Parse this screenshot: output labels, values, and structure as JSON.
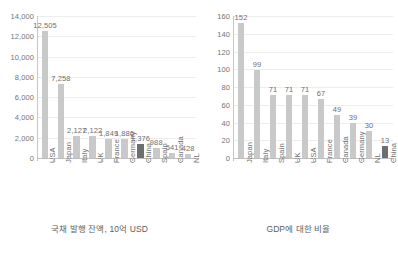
{
  "figure": {
    "width": 398,
    "height": 258,
    "background": "#ffffff",
    "bar_color": "#c9c9c9",
    "highlight_color": "#6e6e6e",
    "gridline_color": "#ededed",
    "axis_color": "#bdbdbd",
    "text_color": "#6f6f6f"
  },
  "chart_data": [
    {
      "type": "bar",
      "title": "",
      "caption": "국채 발행 잔액, 10억 USD",
      "xlabel": "",
      "ylabel": "",
      "ylim": [
        0,
        14000
      ],
      "yticks": [
        "0",
        "2,000",
        "4,000",
        "6,000",
        "8,000",
        "10,000",
        "12,000",
        "14,000"
      ],
      "ytick_values": [
        0,
        2000,
        4000,
        6000,
        8000,
        10000,
        12000,
        14000
      ],
      "grid": true,
      "legend": "none",
      "categories": [
        "USA",
        "Japan",
        "Italy",
        "UK",
        "France",
        "Germany",
        "China",
        "Spain",
        "Canada",
        "NL"
      ],
      "values": [
        12505,
        7258,
        2127,
        2122,
        1849,
        1886,
        1376,
        988,
        541,
        428
      ],
      "value_labels": [
        "12,505",
        "7,258",
        "2,127",
        "2,122",
        "1,849",
        "1,886",
        "1,376",
        "988",
        "541",
        "428"
      ],
      "highlighted": [
        "China"
      ]
    },
    {
      "type": "bar",
      "title": "",
      "caption": "GDP에 대한 비율",
      "xlabel": "",
      "ylabel": "",
      "ylim": [
        0,
        160
      ],
      "yticks": [
        "0",
        "20",
        "40",
        "60",
        "80",
        "100",
        "120",
        "140",
        "160"
      ],
      "ytick_values": [
        0,
        20,
        40,
        60,
        80,
        100,
        120,
        140,
        160
      ],
      "grid": true,
      "legend": "none",
      "categories": [
        "Japan",
        "Italy",
        "Spain",
        "UK",
        "USA",
        "France",
        "Canada",
        "Germany",
        "NL",
        "China"
      ],
      "values": [
        152,
        99,
        71,
        71,
        71,
        67,
        49,
        39,
        30,
        13
      ],
      "value_labels": [
        "152",
        "99",
        "71",
        "71",
        "71",
        "67",
        "49",
        "39",
        "30",
        "13"
      ],
      "highlighted": [
        "China"
      ]
    }
  ]
}
